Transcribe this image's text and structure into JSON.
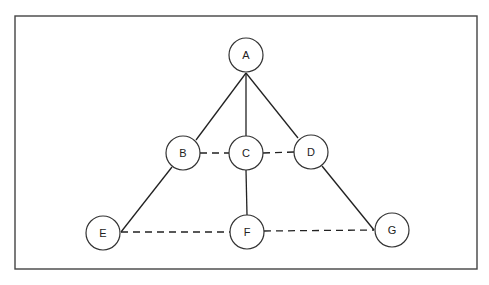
{
  "diagram": {
    "type": "graph",
    "frame": {
      "x": 15,
      "y": 16,
      "width": 462,
      "height": 253
    },
    "node_radius": 17,
    "nodes": [
      {
        "id": "A",
        "label": "A",
        "x": 246,
        "y": 55
      },
      {
        "id": "B",
        "label": "B",
        "x": 183,
        "y": 153
      },
      {
        "id": "C",
        "label": "C",
        "x": 246,
        "y": 153
      },
      {
        "id": "D",
        "label": "D",
        "x": 311,
        "y": 152
      },
      {
        "id": "E",
        "label": "E",
        "x": 103,
        "y": 233
      },
      {
        "id": "F",
        "label": "F",
        "x": 247,
        "y": 232
      },
      {
        "id": "G",
        "label": "G",
        "x": 392,
        "y": 230
      }
    ],
    "edges": [
      {
        "from": "A",
        "to": "B",
        "style": "solid",
        "x1": 246,
        "y1": 73,
        "x2": 196,
        "y2": 140
      },
      {
        "from": "A",
        "to": "C",
        "style": "solid",
        "x1": 246,
        "y1": 73,
        "x2": 246,
        "y2": 136
      },
      {
        "from": "A",
        "to": "D",
        "style": "solid",
        "x1": 246,
        "y1": 73,
        "x2": 298,
        "y2": 138
      },
      {
        "from": "B",
        "to": "C",
        "style": "dashed",
        "x1": 200,
        "y1": 153,
        "x2": 229,
        "y2": 153
      },
      {
        "from": "C",
        "to": "D",
        "style": "dashed",
        "x1": 263,
        "y1": 153,
        "x2": 294,
        "y2": 152
      },
      {
        "from": "B",
        "to": "E",
        "style": "solid",
        "x1": 172,
        "y1": 167,
        "x2": 121,
        "y2": 232
      },
      {
        "from": "C",
        "to": "F",
        "style": "solid",
        "x1": 246,
        "y1": 170,
        "x2": 247,
        "y2": 215
      },
      {
        "from": "D",
        "to": "G",
        "style": "solid",
        "x1": 322,
        "y1": 166,
        "x2": 374,
        "y2": 230
      },
      {
        "from": "E",
        "to": "F",
        "style": "dashed",
        "x1": 121,
        "y1": 232,
        "x2": 230,
        "y2": 232
      },
      {
        "from": "F",
        "to": "G",
        "style": "dashed",
        "x1": 264,
        "y1": 231,
        "x2": 374,
        "y2": 230
      }
    ]
  }
}
